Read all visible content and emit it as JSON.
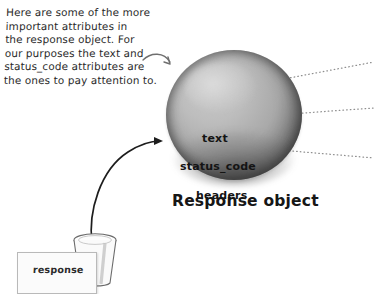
{
  "figure": {
    "annotation": "Here are some of the more\nimportant attributes in\nthe response object. For\nour purposes the text and\nstatus_code attributes are\nthe ones to pay attention to.",
    "caption": "Response object",
    "card_label": "response",
    "attributes": [
      {
        "name": "text"
      },
      {
        "name": "status_code"
      },
      {
        "name": "headers"
      }
    ],
    "colors": {
      "background": "#ffffff",
      "ink": "#1b1b1b",
      "sphere_rim": "#222222",
      "sphere_fill": "#b5b5b5",
      "leader_line": "#8a8a8a",
      "card_fill": "#fbfbfb",
      "card_border": "#b9b9b9"
    }
  }
}
